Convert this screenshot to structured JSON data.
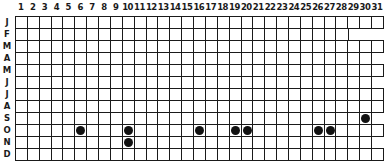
{
  "chart_data": {
    "type": "heatmap",
    "title": "",
    "xlabel": "",
    "ylabel": "",
    "x_tick_labels": [
      "1",
      "2",
      "3",
      "4",
      "5",
      "6",
      "7",
      "8",
      "9",
      "10",
      "11",
      "12",
      "13",
      "14",
      "15",
      "16",
      "17",
      "18",
      "19",
      "20",
      "21",
      "22",
      "23",
      "24",
      "25",
      "26",
      "27",
      "28",
      "29",
      "30",
      "31"
    ],
    "y_tick_labels": [
      "J",
      "F",
      "M",
      "A",
      "M",
      "J",
      "J",
      "A",
      "S",
      "O",
      "N",
      "D"
    ],
    "months": [
      {
        "label": "J",
        "days": 31
      },
      {
        "label": "F",
        "days": 28
      },
      {
        "label": "M",
        "days": 31
      },
      {
        "label": "A",
        "days": 30
      },
      {
        "label": "M",
        "days": 31
      },
      {
        "label": "J",
        "days": 30
      },
      {
        "label": "J",
        "days": 31
      },
      {
        "label": "A",
        "days": 31
      },
      {
        "label": "S",
        "days": 30
      },
      {
        "label": "O",
        "days": 31
      },
      {
        "label": "N",
        "days": 30
      },
      {
        "label": "D",
        "days": 31
      }
    ],
    "marked_days": [
      {
        "month": "S",
        "month_index": 9,
        "day": 30
      },
      {
        "month": "O",
        "month_index": 10,
        "day": 6
      },
      {
        "month": "O",
        "month_index": 10,
        "day": 10
      },
      {
        "month": "O",
        "month_index": 10,
        "day": 16
      },
      {
        "month": "O",
        "month_index": 10,
        "day": 19
      },
      {
        "month": "O",
        "month_index": 10,
        "day": 20
      },
      {
        "month": "O",
        "month_index": 10,
        "day": 26
      },
      {
        "month": "O",
        "month_index": 10,
        "day": 27
      },
      {
        "month": "N",
        "month_index": 11,
        "day": 10
      }
    ],
    "grid": true
  },
  "colors": {
    "grid_line": "#1a1a1a",
    "dot": "#111111",
    "background": "#ffffff"
  }
}
